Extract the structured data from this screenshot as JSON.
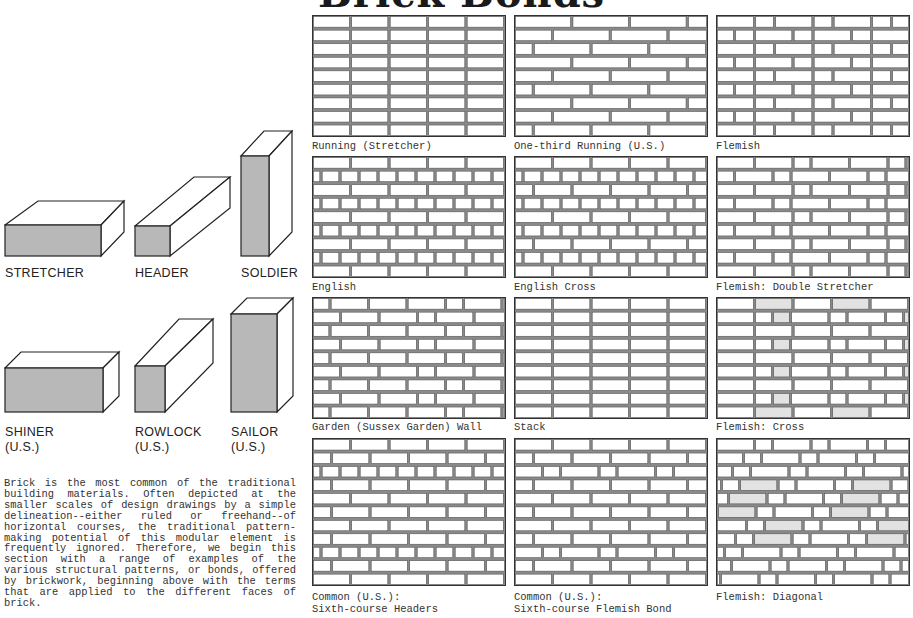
{
  "page": {
    "title": "Brick Bonds"
  },
  "faces": [
    {
      "name": "STRETCHER",
      "sub": ""
    },
    {
      "name": "HEADER",
      "sub": ""
    },
    {
      "name": "SOLDIER",
      "sub": ""
    },
    {
      "name": "SHINER",
      "sub": "(U.S.)"
    },
    {
      "name": "ROWLOCK",
      "sub": "(U.S.)"
    },
    {
      "name": "SAILOR",
      "sub": "(U.S.)"
    }
  ],
  "intro_text": "Brick is the most common of the traditional building materials. Often depicted at the smaller scales of design drawings by a simple delineation--either ruled or freehand--of horizontal courses, the traditional pattern-making potential of this modular element is frequently ignored. Therefore, we begin this section with a range of examples of the various structural patterns, or bonds, offered by brickwork, beginning above with the terms that are applied to the different faces of brick.",
  "colors": {
    "face_shade": "#b8b8b8",
    "line": "#333333",
    "mortar_bg": "#ffffff",
    "accent_shade": "#e2e2e2"
  },
  "bonds": [
    {
      "label_1": "Running (Stretcher)",
      "label_2": "",
      "pattern": "running"
    },
    {
      "label_1": "One-third Running (U.S.)",
      "label_2": "",
      "pattern": "third"
    },
    {
      "label_1": "Flemish",
      "label_2": "",
      "pattern": "flemish"
    },
    {
      "label_1": "English",
      "label_2": "",
      "pattern": "english"
    },
    {
      "label_1": "English Cross",
      "label_2": "",
      "pattern": "englishcross"
    },
    {
      "label_1": "Flemish: Double Stretcher",
      "label_2": "",
      "pattern": "flemishdouble"
    },
    {
      "label_1": "Garden (Sussex Garden) Wall",
      "label_2": "",
      "pattern": "garden"
    },
    {
      "label_1": "Stack",
      "label_2": "",
      "pattern": "stack"
    },
    {
      "label_1": "Flemish: Cross",
      "label_2": "",
      "pattern": "flemishcross"
    },
    {
      "label_1": "Common (U.S.):",
      "label_2": "Sixth-course Headers",
      "pattern": "common"
    },
    {
      "label_1": "Common (U.S.):",
      "label_2": "Sixth-course Flemish Bond",
      "pattern": "commonflemish"
    },
    {
      "label_1": "Flemish: Diagonal",
      "label_2": "",
      "pattern": "flemishdiagonal"
    }
  ]
}
